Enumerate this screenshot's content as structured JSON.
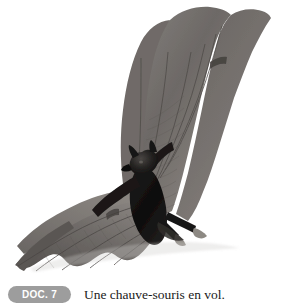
{
  "figure": {
    "badge_label": "DOC. 7",
    "caption": "Une chauve-souris en vol.",
    "badge_color": "#9d9d9d",
    "badge_text_color": "#ffffff",
    "caption_text_color": "#1a1a1a",
    "background_color": "#ffffff"
  },
  "photo": {
    "alt": "Une chauve-souris en vol, photographie en noir et blanc sur fond blanc",
    "subject": "bat-in-flight",
    "palette": {
      "body_dark": "#141414",
      "membrane_mid": "#6e6a68",
      "membrane_light": "#98938f",
      "membrane_shadow": "#4a4745",
      "bone_line": "#514d4b",
      "claw": "#8d8983",
      "background": "#ffffff"
    }
  }
}
